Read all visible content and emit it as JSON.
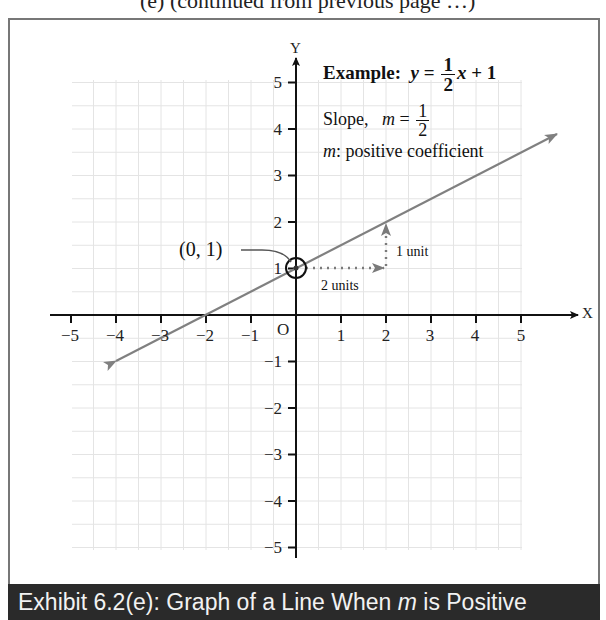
{
  "header_fragment": "(e) (continued from previous page …)",
  "figure": {
    "axis_labels": {
      "x": "X",
      "y": "Y",
      "origin": "O"
    },
    "x_ticks": [
      "−5",
      "−4",
      "−3",
      "−2",
      "−1",
      "1",
      "2",
      "3",
      "4",
      "5"
    ],
    "y_ticks": [
      "5",
      "4",
      "3",
      "2",
      "1",
      "−1",
      "−2",
      "−3",
      "−4",
      "−5"
    ],
    "example": {
      "label": "Example:",
      "lhs": "y",
      "eq": "=",
      "num": "1",
      "den": "2",
      "rest": "x + 1"
    },
    "slope": {
      "label": "Slope,",
      "var": "m",
      "eq": "=",
      "num": "1",
      "den": "2"
    },
    "coefficient_note": {
      "var": "m",
      "text": ": positive coefficient"
    },
    "point_label": "(0, 1)",
    "run_label": "2 units",
    "rise_label": "1 unit"
  },
  "caption": {
    "prefix": "Exhibit 6.2(e): Graph of a Line When ",
    "var": "m",
    "suffix": " is Positive"
  },
  "colors": {
    "line": "#808080",
    "axes": "#111111",
    "grid": "#e2e2e2",
    "caption_bg": "#2a2a2a",
    "caption_text": "#f2f2f2"
  },
  "chart_data": {
    "type": "line",
    "title": "Graph of a Line When m is Positive",
    "equation": "y = (1/2)x + 1",
    "slope": 0.5,
    "intercept": 1,
    "x": [
      -4,
      -2,
      0,
      2,
      4,
      5.8
    ],
    "y": [
      -1,
      0,
      1,
      2,
      3,
      3.9
    ],
    "xlabel": "X",
    "ylabel": "Y",
    "xlim": [
      -5,
      5
    ],
    "ylim": [
      -5,
      5
    ],
    "grid": true,
    "annotations": [
      {
        "text": "(0, 1)",
        "point": [
          0,
          1
        ],
        "type": "circled y-intercept"
      },
      {
        "text": "2 units",
        "from": [
          0,
          1
        ],
        "to": [
          2,
          1
        ],
        "type": "dotted arrow (run)"
      },
      {
        "text": "1 unit",
        "from": [
          2,
          1
        ],
        "to": [
          2,
          2
        ],
        "type": "dotted arrow (rise)"
      }
    ]
  }
}
